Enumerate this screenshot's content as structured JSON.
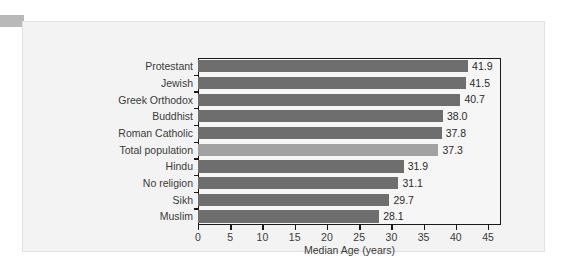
{
  "chart_data": {
    "type": "bar",
    "orientation": "horizontal",
    "title": "",
    "xlabel": "Median Age (years)",
    "ylabel": "",
    "xlim": [
      0,
      47
    ],
    "xticks": [
      0,
      5,
      10,
      15,
      20,
      25,
      30,
      35,
      40,
      45
    ],
    "xtick_labels": [
      "0",
      "5",
      "10",
      "15",
      "20",
      "25",
      "30",
      "35",
      "40",
      "45"
    ],
    "grid": false,
    "legend": null,
    "categories": [
      "Protestant",
      "Jewish",
      "Greek Orthodox",
      "Buddhist",
      "Roman Catholic",
      "Total population",
      "Hindu",
      "No religion",
      "Sikh",
      "Muslim"
    ],
    "values": [
      41.9,
      41.5,
      40.7,
      38.0,
      37.8,
      37.3,
      31.9,
      31.1,
      29.7,
      28.1
    ],
    "value_labels": [
      "41.9",
      "41.5",
      "40.7",
      "38.0",
      "37.8",
      "37.3",
      "31.9",
      "31.1",
      "29.7",
      "28.1"
    ],
    "highlighted_category": "Total population",
    "colors": {
      "bar": "#6e6e6e",
      "bar_highlight": "#a2a2a2",
      "axis": "#1a1a1a",
      "text": "#3a3a3a",
      "panel_background": "#f3f3f3",
      "plot_background": "#f6f6f6"
    }
  }
}
